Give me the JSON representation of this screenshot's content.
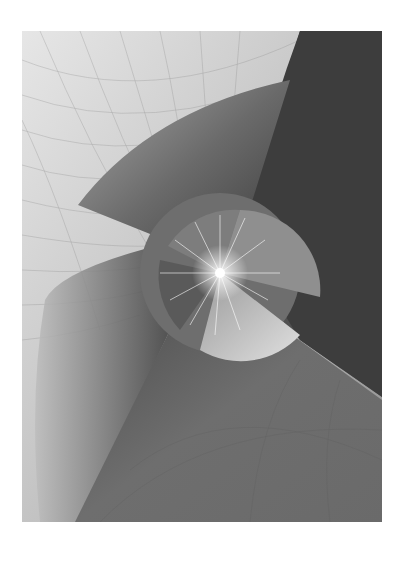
{
  "artwork": {
    "description": "Abstract grayscale composition: curved gridded planes swirl around a bright central starburst inside a segmented circle",
    "palette": {
      "background": "#ffffff",
      "light_plane": "#d9d9d9",
      "mid_plane": "#8c8c8c",
      "dark_plane": "#3a3a3a",
      "grid_line": "#7a7a7a",
      "highlight": "#ffffff"
    },
    "frame": {
      "x": 22,
      "y": 31,
      "width": 360,
      "height": 491
    },
    "center": {
      "x": 220,
      "y": 273
    }
  }
}
